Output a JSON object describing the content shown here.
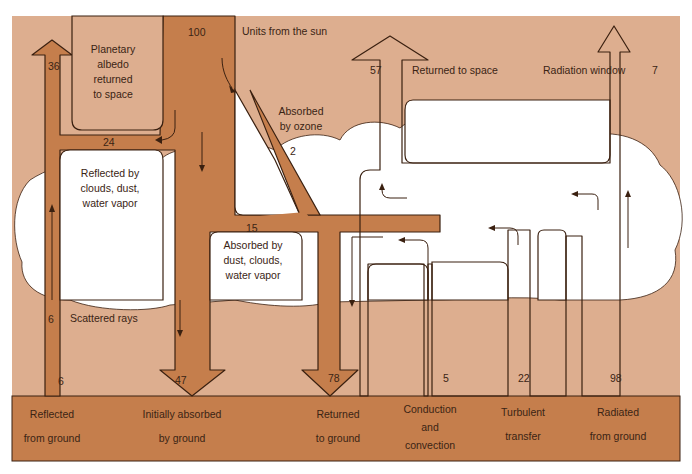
{
  "colors": {
    "sky": "#ddae8f",
    "flow": "#c57e4c",
    "ground": "#c57e4c",
    "cloud": "#ffffff",
    "outline": "#3a2010",
    "text": "#3a2414"
  },
  "diagram": {
    "title_label": "Units from the sun",
    "source_value": "100",
    "flows": [
      {
        "id": "planetary-albedo",
        "value": "36",
        "label": "Planetary albedo returned to space"
      },
      {
        "id": "reflected-clouds",
        "value": "24",
        "label": "Reflected by clouds, dust, water vapor"
      },
      {
        "id": "absorbed-ozone",
        "value": "2",
        "label": "Absorbed by ozone"
      },
      {
        "id": "absorbed-dust",
        "value": "15",
        "label": "Absorbed by dust, clouds, water vapor"
      },
      {
        "id": "scattered-rays",
        "value": "6",
        "label": "Scattered rays"
      },
      {
        "id": "reflected-ground",
        "value": "6",
        "label": "Reflected from ground"
      },
      {
        "id": "initially-absorbed",
        "value": "47",
        "label": "Initially absorbed by ground"
      },
      {
        "id": "returned-to-ground",
        "value": "78",
        "label": "Returned to ground"
      },
      {
        "id": "conduction",
        "value": "5",
        "label": "Conduction and convection"
      },
      {
        "id": "turbulent",
        "value": "22",
        "label": "Turbulent transfer"
      },
      {
        "id": "radiated",
        "value": "98",
        "label": "Radiated from ground"
      },
      {
        "id": "returned-space",
        "value": "57",
        "label": "Returned to space"
      },
      {
        "id": "radiation-window",
        "value": "7",
        "label": "Radiation window"
      }
    ],
    "top_labels": {
      "albedo": [
        "Planetary",
        "albedo",
        "returned",
        "to space"
      ],
      "ozone": [
        "Absorbed",
        "by ozone"
      ],
      "reflected": [
        "Reflected by",
        "clouds, dust,",
        "water vapor"
      ],
      "absorbed_dust": [
        "Absorbed by",
        "dust, clouds,",
        "water vapor"
      ],
      "scattered": "Scattered rays",
      "returned_space": "Returned to space",
      "radiation_window": "Radiation window"
    },
    "values": {
      "v100": "100",
      "v36": "36",
      "v24": "24",
      "v2": "2",
      "v15": "15",
      "v6a": "6",
      "v6b": "6",
      "v47": "47",
      "v78": "78",
      "v5": "5",
      "v22": "22",
      "v98": "98",
      "v57": "57",
      "v7": "7"
    },
    "ground_labels": [
      {
        "line1": "Reflected",
        "line2": "from ground"
      },
      {
        "line1": "Initially absorbed",
        "line2": "by ground"
      },
      {
        "line1": "Returned",
        "line2": "to ground"
      },
      {
        "line1": "Conduction",
        "line2": "and",
        "line3": "convection"
      },
      {
        "line1": "Turbulent",
        "line2": "transfer"
      },
      {
        "line1": "Radiated",
        "line2": "from ground"
      }
    ]
  }
}
